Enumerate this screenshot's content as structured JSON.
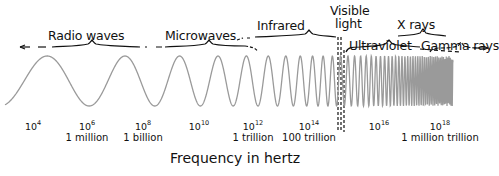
{
  "bands": [
    {
      "name": "Radio waves"
    },
    {
      "name": "Microwaves"
    },
    {
      "name": "Infrared"
    },
    {
      "name": "Visible light",
      "line1": "Visible",
      "line2": "light"
    },
    {
      "name": "Ultraviolet"
    },
    {
      "name": "X rays"
    },
    {
      "name": "Gamma rays"
    }
  ],
  "ticks": [
    {
      "base": "10",
      "exp": "4",
      "label": ""
    },
    {
      "base": "10",
      "exp": "6",
      "label": "1 million"
    },
    {
      "base": "10",
      "exp": "8",
      "label": "1 billion"
    },
    {
      "base": "10",
      "exp": "10",
      "label": ""
    },
    {
      "base": "10",
      "exp": "12",
      "label": "1 trillion"
    },
    {
      "base": "10",
      "exp": "14",
      "label": "100 trillion"
    },
    {
      "base": "10",
      "exp": "16",
      "label": ""
    },
    {
      "base": "10",
      "exp": "18",
      "label": "1 million trillion"
    }
  ],
  "axis_label": "Frequency in hertz",
  "colors": {
    "wave": "#9a9a9a",
    "ink": "#111111"
  }
}
